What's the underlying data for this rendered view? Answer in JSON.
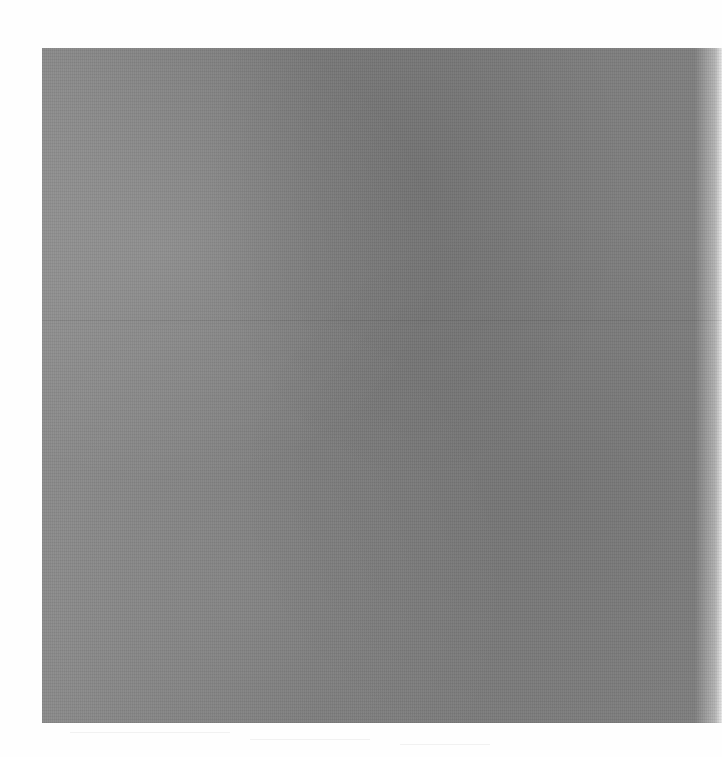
{
  "page": {
    "type": "scanned-page",
    "background_color": "#fefefe"
  },
  "figure": {
    "fill_color": "#7f7f7f",
    "caption": ""
  },
  "footer": {
    "text": ""
  }
}
